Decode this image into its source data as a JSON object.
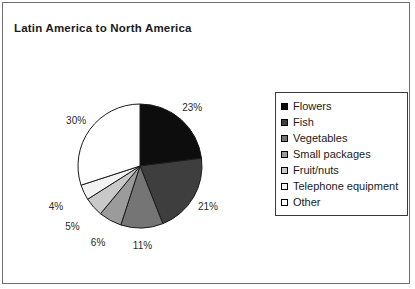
{
  "frame": {
    "border_color": "#6e6e6e",
    "background": "#ffffff"
  },
  "title": "Latin America to North America",
  "legend": {
    "position": "right",
    "border_color": "#3a3a3a",
    "items": [
      {
        "label": "Flowers",
        "color": "#0d0d0d"
      },
      {
        "label": "Fish",
        "color": "#3e3e3e"
      },
      {
        "label": "Vegetables",
        "color": "#757575"
      },
      {
        "label": "Small packages",
        "color": "#9b9b9b"
      },
      {
        "label": "Fruit/nuts",
        "color": "#c9c9c9"
      },
      {
        "label": "Telephone equipment",
        "color": "#f2f2f2"
      },
      {
        "label": "Other",
        "color": "#ffffff"
      }
    ]
  },
  "pie": {
    "center_x": 140,
    "center_y": 166,
    "radius": 62,
    "start_angle_deg": 0,
    "direction": "clockwise",
    "stroke_color": "#1a1a1a",
    "label_offset": 17
  },
  "chart_data": {
    "type": "pie",
    "title": "Latin America to North America",
    "xlabel": "",
    "ylabel": "",
    "grid": false,
    "legend_position": "right",
    "unit": "%",
    "categories": [
      "Flowers",
      "Fish",
      "Vegetables",
      "Small packages",
      "Fruit/nuts",
      "Telephone equipment",
      "Other"
    ],
    "values": [
      23,
      21,
      11,
      6,
      5,
      4,
      30
    ],
    "labels": [
      "23%",
      "21%",
      "11%",
      "6%",
      "5%",
      "4%",
      "30%"
    ],
    "colors": [
      "#0d0d0d",
      "#3e3e3e",
      "#757575",
      "#9b9b9b",
      "#c9c9c9",
      "#f2f2f2",
      "#ffffff"
    ],
    "total": 100
  }
}
